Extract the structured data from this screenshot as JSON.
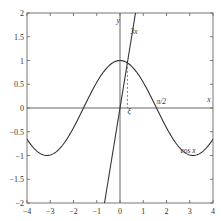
{
  "chart_data": {
    "type": "line",
    "title": "",
    "xlabel": "x",
    "ylabel": "y",
    "xlim": [
      -4,
      4
    ],
    "ylim": [
      -2,
      2
    ],
    "grid": false,
    "x_ticks": [
      -4,
      -3,
      -2,
      -1,
      0,
      1,
      2,
      3,
      4
    ],
    "x_tick_labels": [
      "−4",
      "−3",
      "−2",
      "−1",
      "0",
      "1",
      "2",
      "3",
      "4"
    ],
    "y_ticks": [
      -2,
      -1.5,
      -1,
      -0.5,
      0,
      0.5,
      1,
      1.5,
      2
    ],
    "y_tick_labels": [
      "−2",
      "−1.5",
      "−1",
      "−0.5",
      "0",
      "0.5",
      "1",
      "1.5",
      "2"
    ],
    "series": [
      {
        "name": "cos x",
        "function": "cos(x)",
        "x_range": [
          -4,
          4
        ]
      },
      {
        "name": "3x",
        "function": "3*x",
        "x_range": [
          -0.667,
          0.667
        ]
      }
    ],
    "annotations": [
      {
        "text": "ξ",
        "x": 0.32,
        "y": -0.12,
        "note": "intersection of cos x and 3x, dashed drop line"
      },
      {
        "text": "π/2",
        "x": 1.57,
        "y": 0.08
      },
      {
        "text": "3x",
        "x": 0.45,
        "y": 1.55
      },
      {
        "text": "cos x",
        "x": 2.6,
        "y": -0.95
      },
      {
        "text": "x",
        "x": 3.75,
        "y": 0.12
      },
      {
        "text": "y",
        "x": -0.15,
        "y": 1.8
      }
    ],
    "intersection": {
      "x": 0.3167,
      "y": 0.9502
    }
  },
  "labels": {
    "x_axis": "x",
    "y_axis": "y",
    "xi": "ξ",
    "pi_half": "π/2",
    "line_label": "3x",
    "curve_label": "cos x"
  }
}
